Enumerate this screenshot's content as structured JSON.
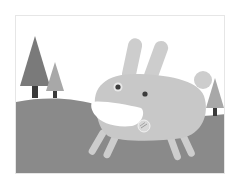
{
  "illustration": {
    "subject": "cartoon rabbit on a hill with trees",
    "colors": {
      "sky": "#ffffff",
      "hill": "#8a8a8a",
      "tree_dark": "#7a7a7a",
      "tree_light": "#a8a8a8",
      "trunk": "#3a3a3a",
      "rabbit_body": "#c8c8c8",
      "rabbit_mouth": "#ffffff",
      "rabbit_eye": "#3c3c3c",
      "tongue": "#d8d8d8"
    },
    "elements": [
      {
        "name": "tree-large-left"
      },
      {
        "name": "tree-small-left"
      },
      {
        "name": "tree-right"
      },
      {
        "name": "rabbit"
      }
    ]
  }
}
